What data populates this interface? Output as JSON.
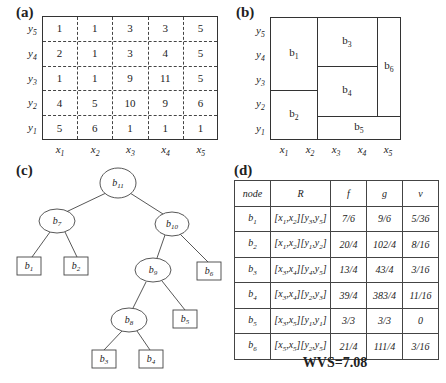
{
  "panel_a": {
    "label": "(a)",
    "row_labels": [
      "y5",
      "y4",
      "y3",
      "y2",
      "y1"
    ],
    "col_labels": [
      "x1",
      "x2",
      "x3",
      "x4",
      "x5"
    ],
    "grid": [
      [
        "1",
        "1",
        "3",
        "3",
        "5"
      ],
      [
        "2",
        "1",
        "3",
        "4",
        "5"
      ],
      [
        "1",
        "1",
        "9",
        "11",
        "5"
      ],
      [
        "4",
        "5",
        "10",
        "9",
        "6"
      ],
      [
        "5",
        "6",
        "1",
        "1",
        "1"
      ]
    ]
  },
  "panel_b": {
    "label": "(b)",
    "row_labels": [
      "y5",
      "y4",
      "y3",
      "y2",
      "y1"
    ],
    "col_labels": [
      "x1",
      "x2",
      "x3",
      "x4",
      "x5"
    ],
    "regions": [
      "b1",
      "b2",
      "b3",
      "b4",
      "b5",
      "b6"
    ]
  },
  "panel_c": {
    "label": "(c)",
    "internal_nodes": [
      "b11",
      "b7",
      "b10",
      "b9",
      "b8"
    ],
    "leaf_nodes": [
      "b1",
      "b2",
      "b6",
      "b5",
      "b3",
      "b4"
    ],
    "edges": [
      [
        "b11",
        "b7"
      ],
      [
        "b11",
        "b10"
      ],
      [
        "b7",
        "b1"
      ],
      [
        "b7",
        "b2"
      ],
      [
        "b10",
        "b9"
      ],
      [
        "b10",
        "b6"
      ],
      [
        "b9",
        "b8"
      ],
      [
        "b9",
        "b5"
      ],
      [
        "b8",
        "b3"
      ],
      [
        "b8",
        "b4"
      ]
    ]
  },
  "panel_d": {
    "label": "(d)",
    "headers": [
      "node",
      "R",
      "f",
      "g",
      "v"
    ],
    "rows": [
      {
        "node": "b1",
        "R": "[x1,x2][y3,y5]",
        "f": "7/6",
        "g": "9/6",
        "v": "5/36"
      },
      {
        "node": "b2",
        "R": "[x1,x2][y1,y2]",
        "f": "20/4",
        "g": "102/4",
        "v": "8/16"
      },
      {
        "node": "b3",
        "R": "[x3,x4][y4,y5]",
        "f": "13/4",
        "g": "43/4",
        "v": "3/16"
      },
      {
        "node": "b4",
        "R": "[x3,x4][y2,y3]",
        "f": "39/4",
        "g": "383/4",
        "v": "11/16"
      },
      {
        "node": "b5",
        "R": "[x3,x5][y1,y1]",
        "f": "3/3",
        "g": "3/3",
        "v": "0"
      },
      {
        "node": "b6",
        "R": "[x5,x5][y2,y5]",
        "f": "21/4",
        "g": "111/4",
        "v": "3/16"
      }
    ],
    "wvs": "WVS=7.08"
  }
}
